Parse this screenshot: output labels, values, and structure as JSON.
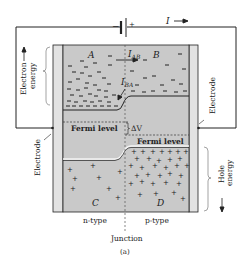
{
  "figure": {
    "caption": "(a)",
    "colors": {
      "semiconductor": "#c9c9c9",
      "electrode": "#e2e2e2",
      "line": "#222222",
      "background": "#ffffff"
    }
  },
  "circuit": {
    "battery_minus": "−",
    "battery_plus": "+",
    "current_label": "I",
    "current_arrow": "⟶"
  },
  "regions": {
    "A": "A",
    "B": "B",
    "C": "C",
    "D": "D"
  },
  "currents": {
    "I_AB": "I",
    "I_AB_sub": "AB",
    "I_BA": "I",
    "I_BA_sub": "BA"
  },
  "levels": {
    "fermi_left": "Fermi level",
    "fermi_right": "Fermi level",
    "delta_v": "ΔV"
  },
  "side_labels": {
    "electron_energy_line1": "Electron",
    "electron_energy_line2": "energy",
    "hole_energy_line1": "Hole",
    "hole_energy_line2": "energy",
    "electrode_left": "Electrode",
    "electrode_right": "Electrode"
  },
  "bottom_labels": {
    "n_type": "n-type",
    "p_type": "p-type",
    "junction": "Junction"
  }
}
